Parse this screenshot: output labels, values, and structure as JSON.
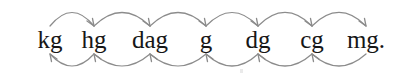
{
  "diagram": {
    "background_color": "#ffffff",
    "text_color": "#171717",
    "arrow_color": "#8c8c8c",
    "units": [
      {
        "label": "kg",
        "name": "kilogram",
        "x": 30,
        "width": 40
      },
      {
        "label": "hg",
        "name": "hectogram",
        "x": 74,
        "width": 40
      },
      {
        "label": "dag",
        "name": "dekagram",
        "x": 122,
        "width": 56
      },
      {
        "label": "g",
        "name": "gram",
        "x": 192,
        "width": 28
      },
      {
        "label": "dg",
        "name": "decigram",
        "x": 238,
        "width": 40
      },
      {
        "label": "cg",
        "name": "centigram",
        "x": 292,
        "width": 40
      },
      {
        "label": "mg.",
        "name": "milligram",
        "x": 340,
        "width": 52
      }
    ],
    "top_arrows": {
      "direction": "left-to-right",
      "arrowhead_position": "end",
      "count": 6,
      "meaning": "multiply by 10 moving right",
      "arcs": [
        {
          "from": "kg",
          "to": "hg",
          "x1": 50,
          "x2": 94,
          "apex_y": 9
        },
        {
          "from": "hg",
          "to": "dag",
          "x1": 94,
          "x2": 150,
          "apex_y": 9
        },
        {
          "from": "dag",
          "to": "g",
          "x1": 150,
          "x2": 206,
          "apex_y": 9
        },
        {
          "from": "g",
          "to": "dg",
          "x1": 206,
          "x2": 258,
          "apex_y": 9
        },
        {
          "from": "dg",
          "to": "cg",
          "x1": 258,
          "x2": 312,
          "apex_y": 9
        },
        {
          "from": "cg",
          "to": "mg.",
          "x1": 312,
          "x2": 366,
          "apex_y": 9
        }
      ]
    },
    "bottom_arrows": {
      "direction": "right-to-left",
      "arrowhead_position": "start",
      "count": 6,
      "meaning": "divide by 10 moving left",
      "arcs": [
        {
          "from": "hg",
          "to": "kg",
          "x1": 50,
          "x2": 94,
          "apex_y": 68
        },
        {
          "from": "dag",
          "to": "hg",
          "x1": 94,
          "x2": 150,
          "apex_y": 68
        },
        {
          "from": "g",
          "to": "dag",
          "x1": 150,
          "x2": 206,
          "apex_y": 68
        },
        {
          "from": "dg",
          "to": "g",
          "x1": 206,
          "x2": 258,
          "apex_y": 68
        },
        {
          "from": "cg",
          "to": "dg",
          "x1": 258,
          "x2": 312,
          "apex_y": 68
        },
        {
          "from": "mg.",
          "to": "cg",
          "x1": 312,
          "x2": 366,
          "apex_y": 68
        }
      ]
    }
  }
}
